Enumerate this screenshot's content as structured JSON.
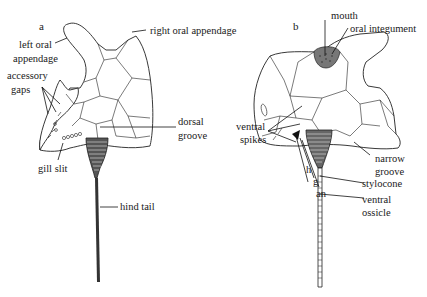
{
  "figure": {
    "panels": [
      {
        "letter": "a",
        "labels": {
          "right_oral_appendage": "right oral appendage",
          "left_oral_appendage_1": "left oral",
          "left_oral_appendage_2": "appendage",
          "accessory_gaps_1": "accessory",
          "accessory_gaps_2": "gaps",
          "dorsal_groove_1": "dorsal",
          "dorsal_groove_2": "groove",
          "gill_slit": "gill slit",
          "hind_tail": "hind tail"
        }
      },
      {
        "letter": "b",
        "labels": {
          "mouth": "mouth",
          "oral_integument": "oral integument",
          "ventral_spikes_1": "ventral",
          "ventral_spikes_2": "spikes",
          "narrow_groove_1": "narrow",
          "narrow_groove_2": "groove",
          "h": "h",
          "g": "g",
          "an": "an",
          "stylocone": "stylocone",
          "ventral_ossicle_1": "ventral",
          "ventral_ossicle_2": "ossicle"
        }
      }
    ],
    "colors": {
      "ink": "#222222",
      "background": "#ffffff"
    }
  }
}
